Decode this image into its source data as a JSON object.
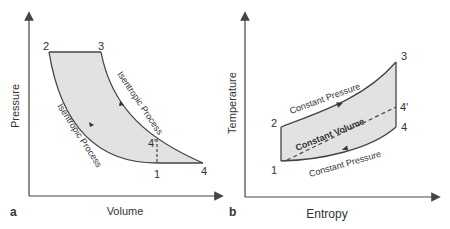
{
  "panels": [
    {
      "id": "a",
      "panel_label": "a",
      "xlabel": "Volume",
      "ylabel": "Pressure",
      "points": {
        "p1": "1",
        "p2": "2",
        "p3": "3",
        "p4": "4",
        "p4p": "4'"
      },
      "processes": {
        "expansion": "Isentropic Process",
        "compression": "Isentropic Process"
      }
    },
    {
      "id": "b",
      "panel_label": "b",
      "xlabel": "Entropy",
      "ylabel": "Temperature",
      "points": {
        "p1": "1",
        "p2": "2",
        "p3": "3",
        "p4": "4",
        "p4p": "4'"
      },
      "processes": {
        "heat_addition": "Constant Pressure",
        "constant_volume": "Constant Volume",
        "heat_rejection": "Constant Pressure"
      }
    }
  ],
  "colors": {
    "line": "#444444",
    "fill": "#e2e2e2",
    "text": "#333333"
  }
}
